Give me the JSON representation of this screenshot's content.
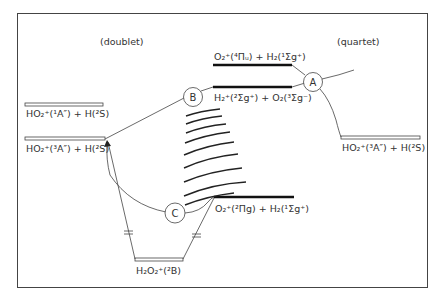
{
  "diagram": {
    "regions": {
      "doublet": "(doublet)",
      "quartet": "(quartet)"
    },
    "levels": [
      {
        "id": "ho2_1A",
        "label": "HO₂⁺(¹A″) + H(²S)",
        "style": "open"
      },
      {
        "id": "ho2_3A_left",
        "label": "HO₂⁺(³A″) + H(²S)",
        "style": "open"
      },
      {
        "id": "o2_4pi",
        "label": "O₂⁺(⁴Πᵤ) + H₂(¹Σg⁺)",
        "style": "bold"
      },
      {
        "id": "h2_2sigma",
        "label": "H₂⁺(²Σg⁺) + O₂(³Σg⁻)",
        "style": "bold"
      },
      {
        "id": "ho2_3A_right",
        "label": "HO₂⁺(³A″) + H(²S)",
        "style": "open"
      },
      {
        "id": "o2_2pi",
        "label": "O₂⁺(²Πg) + H₂(¹Σg⁺)",
        "style": "bold"
      },
      {
        "id": "h2o2",
        "label": "H₂O₂⁺(²B)",
        "style": "open"
      }
    ],
    "crossings": [
      {
        "id": "A",
        "label": "A"
      },
      {
        "id": "B",
        "label": "B"
      },
      {
        "id": "C",
        "label": "C"
      }
    ]
  }
}
